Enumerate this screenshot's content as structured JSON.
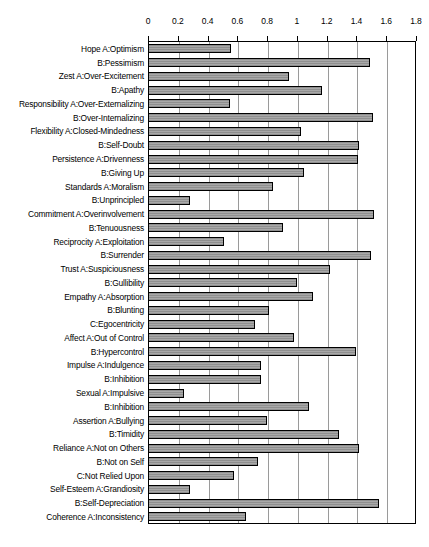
{
  "chart_data": {
    "type": "bar",
    "orientation": "horizontal",
    "title": "",
    "subtitle": "",
    "xlabel": "",
    "ylabel": "",
    "xlim": [
      0,
      1.8
    ],
    "grid": true,
    "legend": "none",
    "xticks": [
      "0",
      "0.2",
      "0.4",
      "0.6",
      "0.8",
      "1",
      "1.2",
      "1.4",
      "1.6",
      "1.8"
    ],
    "xtick_values": [
      0,
      0.2,
      0.4,
      0.6,
      0.8,
      1.0,
      1.2,
      1.4,
      1.6,
      1.8
    ],
    "bar_fill_color": "#a0a0a0",
    "bar_edge_color": "#000000",
    "gridline_color": "#9a9a9a",
    "categories": [
      "Hope A:Optimism",
      "B:Pessimism",
      "Zest A:Over-Excitement",
      "B:Apathy",
      "Responsibility A:Over-Externalizing",
      "B:Over-Internalizing",
      "Flexibility A:Closed-Mindedness",
      "B:Self-Doubt",
      "Persistence A:Drivenness",
      "B:Giving Up",
      "Standards A:Moralism",
      "B:Unprincipled",
      "Commitment A:Overinvolvement",
      "B:Tenuousness",
      "Reciprocity A:Exploitation",
      "B:Surrender",
      "Trust A:Suspiciousness",
      "B:Gullibility",
      "Empathy A:Absorption",
      "B:Blunting",
      "C:Egocentricity",
      "Affect A:Out of Control",
      "B:Hypercontrol",
      "Impulse A:Indulgence",
      "B:Inhibition",
      "Sexual A:Impulsive",
      "B:Inhibition",
      "Assertion A:Bullying",
      "B:Timidity",
      "Reliance A:Not on Others",
      "B:Not on Self",
      "C:Not Relied Upon",
      "Self-Esteem A:Grandiosity",
      "B:Self-Depreciation",
      "Coherence A:Inconsistency"
    ],
    "values": [
      0.56,
      1.49,
      0.95,
      1.17,
      0.55,
      1.51,
      1.03,
      1.42,
      1.41,
      1.05,
      0.84,
      0.28,
      1.52,
      0.91,
      0.51,
      1.5,
      1.22,
      1.0,
      1.11,
      0.81,
      0.72,
      0.98,
      1.4,
      0.76,
      0.76,
      0.24,
      1.08,
      0.8,
      1.28,
      1.42,
      0.74,
      0.58,
      0.28,
      1.55,
      0.66
    ]
  }
}
